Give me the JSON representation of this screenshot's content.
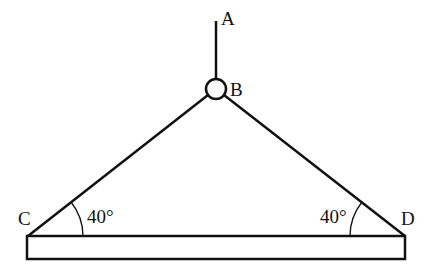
{
  "diagram": {
    "type": "mechanics-free-body",
    "points": {
      "A": {
        "label": "A"
      },
      "B": {
        "label": "B"
      },
      "C": {
        "label": "C"
      },
      "D": {
        "label": "D"
      }
    },
    "angles": {
      "left": "40°",
      "right": "40°"
    },
    "colors": {
      "stroke": "#111111",
      "background": "#ffffff"
    }
  }
}
